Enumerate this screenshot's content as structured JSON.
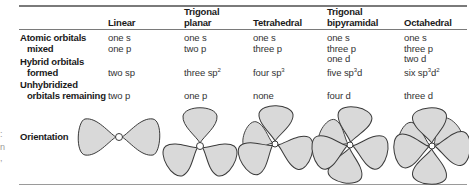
{
  "table": {
    "columns": [
      {
        "key": "linear",
        "header_lines": [
          "Linear"
        ]
      },
      {
        "key": "trigonal_planar",
        "header_lines": [
          "Trigonal",
          "planar"
        ]
      },
      {
        "key": "tetrahedral",
        "header_lines": [
          "Tetrahedral"
        ]
      },
      {
        "key": "trigonal_bipyramidal",
        "header_lines": [
          "Trigonal",
          "bipyramidal"
        ]
      },
      {
        "key": "octahedral",
        "header_lines": [
          "Octahedral"
        ]
      }
    ],
    "rows": {
      "atomic_orbitals_mixed": {
        "label_lines": [
          "Atomic orbitals",
          "mixed"
        ],
        "values": {
          "linear": [
            "one s",
            "one p"
          ],
          "trigonal_planar": [
            "one s",
            "two p"
          ],
          "tetrahedral": [
            "one s",
            "three p"
          ],
          "trigonal_bipyramidal": [
            "one s",
            "three p",
            "one d"
          ],
          "octahedral": [
            "one s",
            "three p",
            "two d"
          ]
        }
      },
      "hybrid_orbitals_formed": {
        "label_lines": [
          "Hybrid orbitals",
          "formed"
        ],
        "values": {
          "linear": {
            "text": "two sp",
            "sup": "",
            "after": "",
            "sup2": ""
          },
          "trigonal_planar": {
            "text": "three sp",
            "sup": "2",
            "after": "",
            "sup2": ""
          },
          "tetrahedral": {
            "text": "four sp",
            "sup": "3",
            "after": "",
            "sup2": ""
          },
          "trigonal_bipyramidal": {
            "text": "five sp",
            "sup": "3",
            "after": "d",
            "sup2": ""
          },
          "octahedral": {
            "text": "six sp",
            "sup": "3",
            "after": "d",
            "sup2": "2"
          }
        }
      },
      "unhybridized_orbitals_remaining": {
        "label_lines": [
          "Unhybridized",
          "orbitals remaining"
        ],
        "values": {
          "linear": "two p",
          "trigonal_planar": "one p",
          "tetrahedral": "none",
          "trigonal_bipyramidal": "four d",
          "octahedral": "three d"
        }
      },
      "orientation": {
        "label_lines": [
          "Orientation"
        ],
        "diagrams": {
          "linear": "linear-orbital-diagram",
          "trigonal_planar": "trigonal-planar-orbital-diagram",
          "tetrahedral": "tetrahedral-orbital-diagram",
          "trigonal_bipyramidal": "trigonal-bipyramidal-orbital-diagram",
          "octahedral": "octahedral-orbital-diagram"
        }
      }
    }
  },
  "colors": {
    "lobe_fill": "#d9d9d9",
    "lobe_stroke": "#3a3a3a",
    "rule": "#7a7a7a"
  },
  "edge_fragments": [
    ":",
    "n",
    ","
  ]
}
